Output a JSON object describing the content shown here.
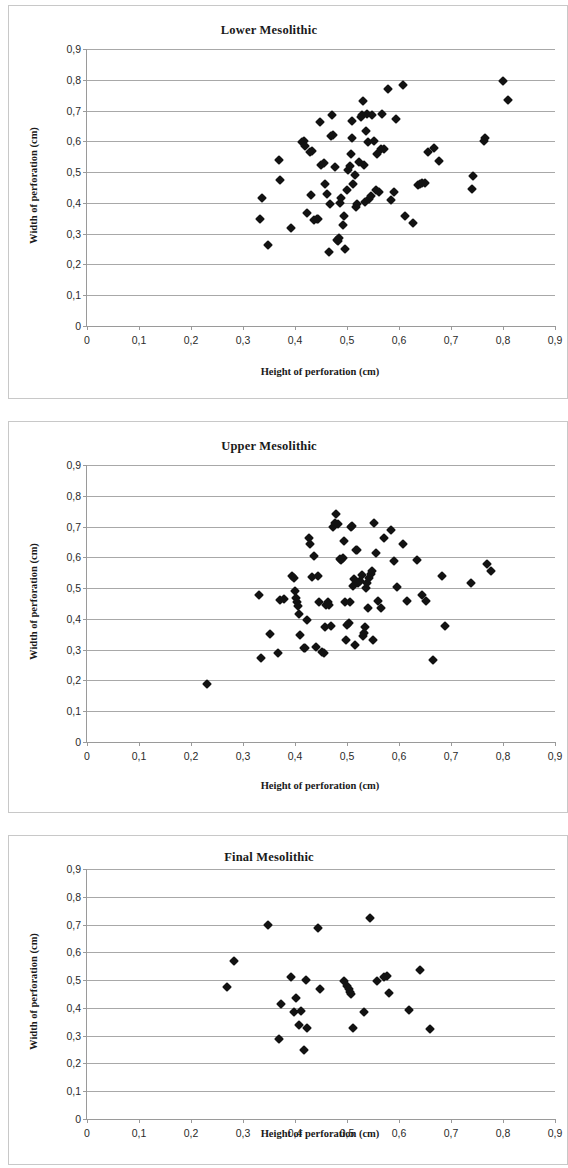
{
  "page": {
    "background": "#ffffff",
    "marker_color": "#121212",
    "axis_color": "#9a9a9a",
    "grid_color": "#a8a8a8",
    "panel_border_color": "#c8c8c8"
  },
  "charts": [
    {
      "title": "Lower Mesolithic",
      "xlabel": "Height of perforation (cm)",
      "ylabel": "Width of perforation (cm)",
      "xticks": [
        "0",
        "0,1",
        "0,2",
        "0,3",
        "0,4",
        "0,5",
        "0,6",
        "0,7",
        "0,8",
        "0,9"
      ],
      "yticks": [
        "0",
        "0,1",
        "0,2",
        "0,3",
        "0,4",
        "0,5",
        "0,6",
        "0,7",
        "0,8",
        "0,9"
      ]
    },
    {
      "title": "Upper Mesolithic",
      "xlabel": "Height of perforation (cm)",
      "ylabel": "Width of perforation (cm)",
      "xticks": [
        "0",
        "0,1",
        "0,2",
        "0,3",
        "0,4",
        "0,5",
        "0,6",
        "0,7",
        "0,8",
        "0,9"
      ],
      "yticks": [
        "0",
        "0,1",
        "0,2",
        "0,3",
        "0,4",
        "0,5",
        "0,6",
        "0,7",
        "0,8",
        "0,9"
      ]
    },
    {
      "title": "Final Mesolithic",
      "xlabel": "Height of perforation (cm)",
      "ylabel": "Width of perforation (cm)",
      "xticks": [
        "0",
        "0,1",
        "0,2",
        "0,3",
        "0,4",
        "0,5",
        "0,6",
        "0,7",
        "0,8",
        "0,9"
      ],
      "yticks": [
        "0",
        "0,1",
        "0,2",
        "0,3",
        "0,4",
        "0,5",
        "0,6",
        "0,7",
        "0,8",
        "0,9"
      ]
    }
  ],
  "chart_data": [
    {
      "type": "scatter",
      "title": "Lower Mesolithic",
      "xlabel": "Height of perforation (cm)",
      "ylabel": "Width of perforation (cm)",
      "xlim": [
        0,
        0.9
      ],
      "ylim": [
        0,
        0.9
      ],
      "xticks": [
        0,
        0.1,
        0.2,
        0.3,
        0.4,
        0.5,
        0.6,
        0.7,
        0.8,
        0.9
      ],
      "yticks": [
        0,
        0.1,
        0.2,
        0.3,
        0.4,
        0.5,
        0.6,
        0.7,
        0.8,
        0.9
      ],
      "grid": "horizontal",
      "legend": null,
      "series": [
        {
          "name": "perforations",
          "marker": "diamond",
          "color": "#121212",
          "points": [
            [
              0.333,
              0.349
            ],
            [
              0.336,
              0.417
            ],
            [
              0.348,
              0.262
            ],
            [
              0.369,
              0.538
            ],
            [
              0.371,
              0.474
            ],
            [
              0.392,
              0.318
            ],
            [
              0.413,
              0.597
            ],
            [
              0.417,
              0.6
            ],
            [
              0.42,
              0.586
            ],
            [
              0.424,
              0.368
            ],
            [
              0.428,
              0.564
            ],
            [
              0.43,
              0.427
            ],
            [
              0.432,
              0.57
            ],
            [
              0.437,
              0.343
            ],
            [
              0.442,
              0.347
            ],
            [
              0.445,
              0.348
            ],
            [
              0.448,
              0.662
            ],
            [
              0.45,
              0.523
            ],
            [
              0.455,
              0.531
            ],
            [
              0.458,
              0.461
            ],
            [
              0.462,
              0.428
            ],
            [
              0.465,
              0.239
            ],
            [
              0.468,
              0.396
            ],
            [
              0.47,
              0.618
            ],
            [
              0.472,
              0.684
            ],
            [
              0.474,
              0.622
            ],
            [
              0.476,
              0.515
            ],
            [
              0.48,
              0.281
            ],
            [
              0.482,
              0.276
            ],
            [
              0.484,
              0.287
            ],
            [
              0.487,
              0.4
            ],
            [
              0.489,
              0.416
            ],
            [
              0.492,
              0.329
            ],
            [
              0.495,
              0.356
            ],
            [
              0.497,
              0.249
            ],
            [
              0.5,
              0.443
            ],
            [
              0.502,
              0.507
            ],
            [
              0.505,
              0.52
            ],
            [
              0.507,
              0.56
            ],
            [
              0.509,
              0.666
            ],
            [
              0.51,
              0.612
            ],
            [
              0.512,
              0.46
            ],
            [
              0.515,
              0.489
            ],
            [
              0.517,
              0.388
            ],
            [
              0.52,
              0.396
            ],
            [
              0.523,
              0.532
            ],
            [
              0.526,
              0.678
            ],
            [
              0.528,
              0.686
            ],
            [
              0.53,
              0.731
            ],
            [
              0.532,
              0.523
            ],
            [
              0.534,
              0.404
            ],
            [
              0.536,
              0.635
            ],
            [
              0.538,
              0.688
            ],
            [
              0.54,
              0.599
            ],
            [
              0.543,
              0.413
            ],
            [
              0.546,
              0.421
            ],
            [
              0.548,
              0.686
            ],
            [
              0.552,
              0.601
            ],
            [
              0.556,
              0.443
            ],
            [
              0.558,
              0.56
            ],
            [
              0.562,
              0.437
            ],
            [
              0.565,
              0.574
            ],
            [
              0.568,
              0.688
            ],
            [
              0.572,
              0.574
            ],
            [
              0.578,
              0.77
            ],
            [
              0.585,
              0.408
            ],
            [
              0.59,
              0.436
            ],
            [
              0.594,
              0.671
            ],
            [
              0.607,
              0.783
            ],
            [
              0.612,
              0.356
            ],
            [
              0.627,
              0.334
            ],
            [
              0.636,
              0.457
            ],
            [
              0.64,
              0.46
            ],
            [
              0.645,
              0.463
            ],
            [
              0.65,
              0.466
            ],
            [
              0.656,
              0.566
            ],
            [
              0.667,
              0.578
            ],
            [
              0.676,
              0.536
            ],
            [
              0.74,
              0.445
            ],
            [
              0.742,
              0.488
            ],
            [
              0.763,
              0.6
            ],
            [
              0.766,
              0.611
            ],
            [
              0.8,
              0.796
            ],
            [
              0.81,
              0.734
            ]
          ]
        }
      ]
    },
    {
      "type": "scatter",
      "title": "Upper Mesolithic",
      "xlabel": "Height of perforation (cm)",
      "ylabel": "Width of perforation (cm)",
      "xlim": [
        0,
        0.9
      ],
      "ylim": [
        0,
        0.9
      ],
      "xticks": [
        0,
        0.1,
        0.2,
        0.3,
        0.4,
        0.5,
        0.6,
        0.7,
        0.8,
        0.9
      ],
      "yticks": [
        0,
        0.1,
        0.2,
        0.3,
        0.4,
        0.5,
        0.6,
        0.7,
        0.8,
        0.9
      ],
      "grid": "horizontal",
      "legend": null,
      "series": [
        {
          "name": "perforations",
          "marker": "diamond",
          "color": "#121212",
          "points": [
            [
              0.23,
              0.19
            ],
            [
              0.33,
              0.478
            ],
            [
              0.335,
              0.272
            ],
            [
              0.352,
              0.352
            ],
            [
              0.368,
              0.29
            ],
            [
              0.372,
              0.462
            ],
            [
              0.378,
              0.466
            ],
            [
              0.395,
              0.538
            ],
            [
              0.398,
              0.532
            ],
            [
              0.4,
              0.489
            ],
            [
              0.402,
              0.468
            ],
            [
              0.404,
              0.455
            ],
            [
              0.406,
              0.442
            ],
            [
              0.407,
              0.416
            ],
            [
              0.41,
              0.347
            ],
            [
              0.418,
              0.305
            ],
            [
              0.42,
              0.304
            ],
            [
              0.423,
              0.396
            ],
            [
              0.426,
              0.663
            ],
            [
              0.428,
              0.644
            ],
            [
              0.432,
              0.536
            ],
            [
              0.436,
              0.603
            ],
            [
              0.44,
              0.308
            ],
            [
              0.444,
              0.538
            ],
            [
              0.447,
              0.455
            ],
            [
              0.452,
              0.292
            ],
            [
              0.455,
              0.29
            ],
            [
              0.458,
              0.373
            ],
            [
              0.46,
              0.446
            ],
            [
              0.463,
              0.456
            ],
            [
              0.466,
              0.445
            ],
            [
              0.47,
              0.378
            ],
            [
              0.473,
              0.7
            ],
            [
              0.476,
              0.712
            ],
            [
              0.478,
              0.74
            ],
            [
              0.482,
              0.707
            ],
            [
              0.486,
              0.595
            ],
            [
              0.489,
              0.59
            ],
            [
              0.492,
              0.598
            ],
            [
              0.494,
              0.652
            ],
            [
              0.496,
              0.456
            ],
            [
              0.498,
              0.33
            ],
            [
              0.5,
              0.38
            ],
            [
              0.503,
              0.386
            ],
            [
              0.505,
              0.456
            ],
            [
              0.508,
              0.697
            ],
            [
              0.51,
              0.703
            ],
            [
              0.512,
              0.508
            ],
            [
              0.514,
              0.531
            ],
            [
              0.516,
              0.315
            ],
            [
              0.518,
              0.625
            ],
            [
              0.52,
              0.623
            ],
            [
              0.522,
              0.515
            ],
            [
              0.525,
              0.522
            ],
            [
              0.528,
              0.541
            ],
            [
              0.53,
              0.344
            ],
            [
              0.532,
              0.355
            ],
            [
              0.534,
              0.373
            ],
            [
              0.536,
              0.5
            ],
            [
              0.538,
              0.516
            ],
            [
              0.54,
              0.437
            ],
            [
              0.543,
              0.534
            ],
            [
              0.546,
              0.546
            ],
            [
              0.548,
              0.556
            ],
            [
              0.55,
              0.332
            ],
            [
              0.552,
              0.711
            ],
            [
              0.556,
              0.615
            ],
            [
              0.56,
              0.458
            ],
            [
              0.565,
              0.437
            ],
            [
              0.572,
              0.664
            ],
            [
              0.584,
              0.688
            ],
            [
              0.59,
              0.588
            ],
            [
              0.596,
              0.505
            ],
            [
              0.608,
              0.644
            ],
            [
              0.615,
              0.458
            ],
            [
              0.635,
              0.59
            ],
            [
              0.645,
              0.478
            ],
            [
              0.652,
              0.459
            ],
            [
              0.665,
              0.268
            ],
            [
              0.682,
              0.54
            ],
            [
              0.688,
              0.376
            ],
            [
              0.738,
              0.515
            ],
            [
              0.77,
              0.578
            ],
            [
              0.776,
              0.556
            ]
          ]
        }
      ]
    },
    {
      "type": "scatter",
      "title": "Final Mesolithic",
      "xlabel": "Height of perforation (cm)",
      "ylabel": "Width of perforation (cm)",
      "xlim": [
        0,
        0.9
      ],
      "ylim": [
        0,
        0.9
      ],
      "xticks": [
        0,
        0.1,
        0.2,
        0.3,
        0.4,
        0.5,
        0.6,
        0.7,
        0.8,
        0.9
      ],
      "yticks": [
        0,
        0.1,
        0.2,
        0.3,
        0.4,
        0.5,
        0.6,
        0.7,
        0.8,
        0.9
      ],
      "grid": "horizontal",
      "legend": null,
      "series": [
        {
          "name": "perforations",
          "marker": "diamond",
          "color": "#121212",
          "points": [
            [
              0.27,
              0.474
            ],
            [
              0.283,
              0.57
            ],
            [
              0.348,
              0.7
            ],
            [
              0.37,
              0.288
            ],
            [
              0.374,
              0.415
            ],
            [
              0.392,
              0.511
            ],
            [
              0.398,
              0.386
            ],
            [
              0.402,
              0.437
            ],
            [
              0.408,
              0.34
            ],
            [
              0.412,
              0.388
            ],
            [
              0.418,
              0.247
            ],
            [
              0.422,
              0.5
            ],
            [
              0.424,
              0.327
            ],
            [
              0.445,
              0.689
            ],
            [
              0.448,
              0.468
            ],
            [
              0.495,
              0.496
            ],
            [
              0.5,
              0.48
            ],
            [
              0.503,
              0.468
            ],
            [
              0.506,
              0.458
            ],
            [
              0.508,
              0.45
            ],
            [
              0.512,
              0.326
            ],
            [
              0.533,
              0.387
            ],
            [
              0.545,
              0.722
            ],
            [
              0.558,
              0.496
            ],
            [
              0.572,
              0.51
            ],
            [
              0.576,
              0.515
            ],
            [
              0.58,
              0.455
            ],
            [
              0.62,
              0.393
            ],
            [
              0.64,
              0.536
            ],
            [
              0.66,
              0.325
            ]
          ]
        }
      ]
    }
  ]
}
